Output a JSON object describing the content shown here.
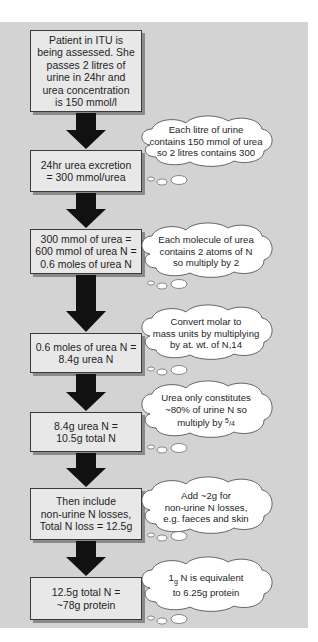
{
  "flowchart": {
    "title": "Estimating nitrogen balance from 24hr urinary urea",
    "steps": [
      {
        "id": "step-1",
        "text": "Patient in ITU is\nbeing assessed. She\npasses 2 litres of\nurine in 24hr and\nurea concentration\nis 150 mmol/l"
      },
      {
        "id": "step-2",
        "text": "24hr urea excretion\n= 300 mmol/urea"
      },
      {
        "id": "step-3",
        "text": "300 mmol of urea =\n600 mmol of urea N =\n0.6 moles of urea N"
      },
      {
        "id": "step-4",
        "text": "0.6 moles of urea N =\n8.4g urea N"
      },
      {
        "id": "step-5",
        "text": "8.4g urea N =\n10.5g total N"
      },
      {
        "id": "step-6",
        "text": "Then include\nnon-urine N losses,\nTotal N loss = 12.5g"
      },
      {
        "id": "step-7",
        "text": "12.5g total N =\n~78g protein"
      }
    ],
    "notes": [
      {
        "id": "note-1",
        "text": "Each litre of urine\ncontains 150 mmol of urea\nso 2 litres contains 300"
      },
      {
        "id": "note-2",
        "text": "Each molecule of urea\ncontains 2 atoms of N\nso multiply by 2"
      },
      {
        "id": "note-3",
        "text": "Convert molar to\nmass units by multiplying\nby at. wt. of N,14"
      },
      {
        "id": "note-4a",
        "text": "Urea only constitutes\n~80% of urine N so\nmultiply by ",
        "fraction_num": "5",
        "fraction_den": "/4"
      },
      {
        "id": "note-5",
        "text": "Add ~2g for\nnon-urine N losses,\ne.g. faeces and skin"
      },
      {
        "id": "note-6",
        "prefix": "1",
        "unit": "g",
        "text": " N is equivalent\nto 6.25g protein"
      }
    ]
  },
  "colors": {
    "panel": "#d3d3d3",
    "box_fill": "#e8e8e8",
    "box_border": "#3a3a3a",
    "box_shadow": "#8a8a8a",
    "arrow": "#111111",
    "cloud_fill": "#ffffff",
    "cloud_stroke": "#444444"
  }
}
